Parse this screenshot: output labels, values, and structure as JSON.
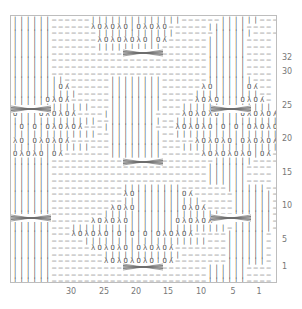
{
  "chart_data": {
    "type": "table",
    "xlabel": "stitch",
    "ylabel": "row",
    "x_ticks": [
      "30",
      "25",
      "20",
      "15",
      "10",
      "5",
      "1"
    ],
    "y_ticks": [
      "32",
      "30",
      "25",
      "20",
      "15",
      "10",
      "5",
      "1"
    ],
    "legend": {
      "|": "knit",
      "-": "purl",
      "O": "yarn over",
      "λ": "ssk / left-leaning decrease",
      "ʎ": "k2tog / right-leaning decrease",
      "cable": "cable crossing over 6 stitches"
    },
    "columns": 41,
    "rows_shown": 40,
    "cable_rows": [
      2,
      10,
      18,
      26,
      34
    ],
    "cable_columns": [
      [
        0,
        5
      ],
      [
        18,
        23
      ],
      [
        34,
        39
      ]
    ]
  },
  "grid": {
    "rows": [
      "||||||------||||||||||||||------||||||----",
      "||||||------λOλOλO|OλOλO------||||||----",
      "||||||-------||||||||||||------||||||----",
      "||||||-------λOλOλOλO|Oʎ------||||||----",
      "||||||-------||||||||||-------||||||----",
      "||||||------------------------||||||----",
      "||||||------------------------||||||----",
      "||||||------------------------||||||----",
      "||||||------------------------||||||----",
      "||||||||-------||||||||-------|||||||---",
      "|||||||Oʎ------||||||||------λO|||||Oʎ--",
      "||||||||||-----||||||||-----||||||||||--",
      "|||||OλOʎ------||||||||-----λOλO|||OλOʎ-",
      "||||||||||||---||||||||---||||||||||||||",
      "O|||OλOλOʎ----||||||||----λOλOλO|||OλOλOʎ",
      "|||||||||||||--||||||||--||||||||||||||||",
      "|O|O|OλOλOʎ---||||||||---λOλOλO|O|O|OλOλOʎ",
      "|||||||||||||--||||||||--|||||||||||||||||",
      "λO|OλOλOʎ------||||||||-----λOλOλO|OλOλOʎ-",
      "||||||||||||---||||||||---|||||||||||||||-",
      "OλOλO|Oʎ-------||||||||------λOλOλOλO|Oʎ--",
      "||||||-------------------------||||||----",
      "||||||------------------------||||||----",
      "||||||------------------------||||||----",
      "||||||------------------------||||||----",
      "||||||-----------|||||||||-------||||||--",
      "||||||-----------λO|||||||Oʎ------||||||-",
      "||||||-----------||||||||||||-----||||||-",
      "||||||---------λOλO|||||||OλOʎ----||||||-",
      "||||||--------||||||||||||||||||--||||||-",
      "||||||------λOλOλO|||||||OλOλOʎ---||||||-",
      "||||||---||||||||||||||||||||||||-||||||-",
      "||||||---λOλOλO|O|O|O|OλOλOʎ-----||||||-",
      "||||||-----|||||||||||||||||||---||||||-",
      "||||||------λOλOλO|OλOλOʎ--------||||||-",
      "||||||--------||||||||||||-------||||||-",
      "||||||--------λOλOλOλO|Oʎ--------||||||-",
      "||||||------------------------||||||----",
      "||||||------------------------||||||----",
      "||||||------------------------||||||----"
    ]
  }
}
